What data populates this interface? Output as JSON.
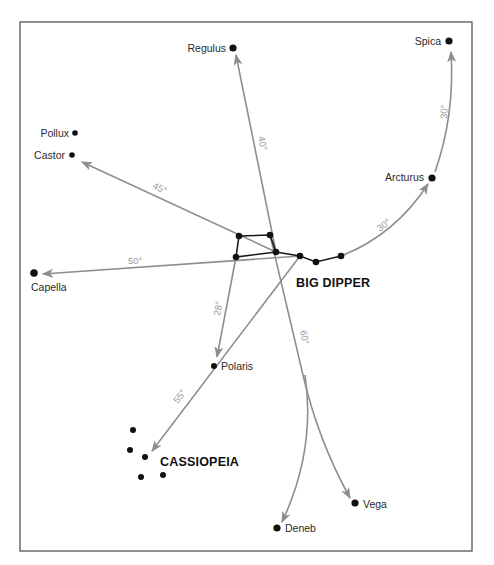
{
  "diagram": {
    "colors": {
      "background": "#ffffff",
      "frame": "#555555",
      "pointer_lines": "#8e8e8e",
      "stars": "#111111",
      "angle_labels": "#9a9a9a"
    },
    "constellations": {
      "big_dipper": {
        "label": "BIG DIPPER"
      },
      "cassiopeia": {
        "label": "CASSIOPEIA"
      }
    },
    "stars": {
      "regulus": {
        "label": "Regulus"
      },
      "spica": {
        "label": "Spica"
      },
      "pollux": {
        "label": "Pollux"
      },
      "castor": {
        "label": "Castor"
      },
      "arcturus": {
        "label": "Arcturus"
      },
      "capella": {
        "label": "Capella"
      },
      "polaris": {
        "label": "Polaris"
      },
      "vega": {
        "label": "Vega"
      },
      "deneb": {
        "label": "Deneb"
      }
    },
    "angles": {
      "to_regulus": "40°",
      "to_castor": "45°",
      "to_capella": "50°",
      "to_polaris": "28°",
      "to_cassiopeia": "55°",
      "to_vega_deneb": "60°",
      "to_arcturus": "30°",
      "to_spica": "30°"
    }
  }
}
